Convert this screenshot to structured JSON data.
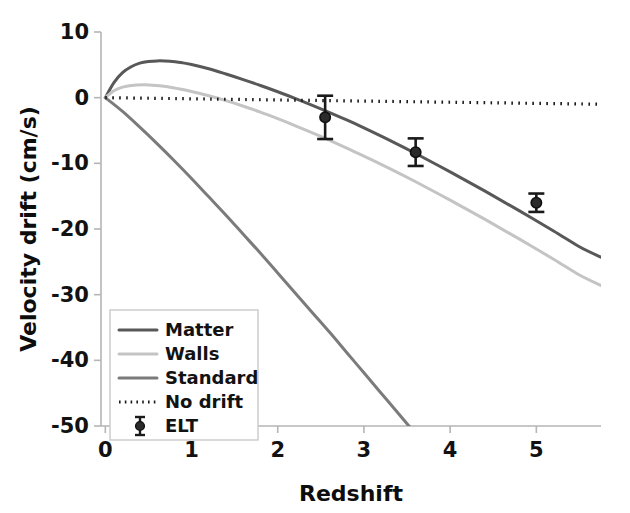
{
  "chart_data": {
    "type": "line",
    "title": "",
    "xlabel": "Redshift",
    "ylabel": "Velocity drift (cm/s)",
    "xlim": [
      -0.05,
      5.75
    ],
    "ylim": [
      -50,
      10
    ],
    "xticks": [
      "0",
      "1",
      "2",
      "3",
      "4",
      "5"
    ],
    "xtick_values": [
      0,
      1,
      2,
      3,
      4,
      5
    ],
    "yticks": [
      "10",
      "0",
      "-10",
      "-20",
      "-30",
      "-40",
      "-50"
    ],
    "ytick_values": [
      10,
      0,
      -10,
      -20,
      -30,
      -40,
      -50
    ],
    "grid": false,
    "legend_position": "lower-left",
    "series": [
      {
        "name": "Matter",
        "style": "solid",
        "color": "#585858",
        "x": [
          0.0,
          0.1,
          0.2,
          0.3,
          0.4,
          0.5,
          0.6,
          0.75,
          0.9,
          1.0,
          1.2,
          1.4,
          1.6,
          1.8,
          2.0,
          2.2,
          2.5,
          2.8,
          3.0,
          3.3,
          3.6,
          4.0,
          4.4,
          4.8,
          5.2,
          5.5,
          5.75
        ],
        "y": [
          0.0,
          2.3,
          3.8,
          4.7,
          5.25,
          5.5,
          5.6,
          5.55,
          5.3,
          5.05,
          4.4,
          3.6,
          2.75,
          1.85,
          0.9,
          -0.1,
          -1.7,
          -3.4,
          -4.6,
          -6.5,
          -8.5,
          -11.3,
          -14.2,
          -17.2,
          -20.3,
          -22.7,
          -24.3
        ]
      },
      {
        "name": "Walls",
        "style": "solid",
        "color": "#c4c4c4",
        "x": [
          0.0,
          0.1,
          0.2,
          0.3,
          0.45,
          0.55,
          0.7,
          0.85,
          1.0,
          1.2,
          1.4,
          1.6,
          1.8,
          2.0,
          2.2,
          2.5,
          2.8,
          3.0,
          3.3,
          3.6,
          4.0,
          4.4,
          4.8,
          5.2,
          5.5,
          5.75
        ],
        "y": [
          0.0,
          1.05,
          1.6,
          1.85,
          1.95,
          1.9,
          1.7,
          1.35,
          0.95,
          0.3,
          -0.45,
          -1.3,
          -2.2,
          -3.2,
          -4.25,
          -5.9,
          -7.7,
          -8.9,
          -10.8,
          -12.8,
          -15.6,
          -18.5,
          -21.5,
          -24.6,
          -27.0,
          -28.6
        ]
      },
      {
        "name": "Standard",
        "style": "solid",
        "color": "#7b7b7b",
        "x": [
          0.0,
          0.2,
          0.4,
          0.6,
          0.8,
          1.0,
          1.2,
          1.4,
          1.6,
          1.8,
          2.0,
          2.2,
          2.4,
          2.6,
          2.8,
          3.0,
          3.2,
          3.4,
          3.6,
          3.8
        ],
        "y": [
          0.0,
          -2.1,
          -4.5,
          -7.0,
          -9.6,
          -12.3,
          -15.1,
          -17.9,
          -20.8,
          -23.7,
          -26.7,
          -29.7,
          -32.7,
          -35.7,
          -38.8,
          -41.9,
          -45.0,
          -48.1,
          -51.2,
          -54.3
        ]
      },
      {
        "name": "No drift",
        "style": "dotted",
        "color": "#1a1a1a",
        "x": [
          0.0,
          5.75
        ],
        "y": [
          0.0,
          -1.0
        ]
      }
    ],
    "points": {
      "name": "ELT",
      "color": "#1a1a1a",
      "marker": "circle-errorbar",
      "x": [
        2.55,
        3.6,
        5.0
      ],
      "y": [
        -3.0,
        -8.3,
        -16.0
      ],
      "yerr": [
        3.3,
        2.1,
        1.4
      ]
    }
  },
  "legend": {
    "entries": [
      {
        "label": "Matter",
        "type": "line",
        "color": "#585858"
      },
      {
        "label": "Walls",
        "type": "line",
        "color": "#c4c4c4"
      },
      {
        "label": "Standard",
        "type": "line",
        "color": "#7b7b7b"
      },
      {
        "label": "No drift",
        "type": "dotted",
        "color": "#1a1a1a"
      },
      {
        "label": "ELT",
        "type": "marker",
        "color": "#1a1a1a"
      }
    ]
  },
  "colors": {
    "axis": "#b5b5b5",
    "text": "#121212",
    "background": "#ffffff"
  }
}
